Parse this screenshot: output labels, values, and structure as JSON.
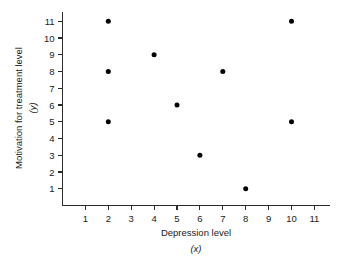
{
  "chart_data": {
    "type": "scatter",
    "title": "",
    "xlabel": "Depression level",
    "xlabel_variable": "(x)",
    "ylabel": "Motivation for treatment level",
    "ylabel_variable": "(y)",
    "grid": false,
    "legend": "none",
    "xlim": [
      0,
      11.7
    ],
    "ylim": [
      0,
      11.6
    ],
    "xticks": [
      1,
      2,
      3,
      4,
      5,
      6,
      7,
      8,
      9,
      10,
      11
    ],
    "yticks": [
      1,
      2,
      3,
      4,
      5,
      6,
      7,
      8,
      9,
      10,
      11
    ],
    "xtick_labels": [
      "1",
      "2",
      "3",
      "4",
      "5",
      "6",
      "7",
      "8",
      "9",
      "10",
      "11"
    ],
    "ytick_labels": [
      "1",
      "2",
      "3",
      "4",
      "5",
      "6",
      "7",
      "8",
      "9",
      "10",
      "11"
    ],
    "marker": "filled-circle",
    "marker_color": "#000000",
    "marker_size": 5,
    "points": [
      {
        "x": 2,
        "y": 11
      },
      {
        "x": 2,
        "y": 8
      },
      {
        "x": 2,
        "y": 5
      },
      {
        "x": 4,
        "y": 9
      },
      {
        "x": 5,
        "y": 6
      },
      {
        "x": 6,
        "y": 3
      },
      {
        "x": 7,
        "y": 8
      },
      {
        "x": 8,
        "y": 1
      },
      {
        "x": 10,
        "y": 11
      },
      {
        "x": 10,
        "y": 5
      }
    ],
    "x_values": [
      2,
      2,
      2,
      4,
      5,
      6,
      7,
      8,
      10,
      10
    ],
    "y_values": [
      11,
      8,
      5,
      9,
      6,
      3,
      8,
      1,
      11,
      5
    ],
    "n_points": 10,
    "axis_color": "#2b2b2b",
    "background_color": "#ffffff"
  }
}
